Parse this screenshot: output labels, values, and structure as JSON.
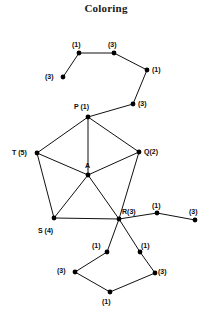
{
  "title": "Coloring",
  "canvas": {
    "width": 212,
    "height": 319,
    "background": "#ffffff"
  },
  "colors": {
    "edge": "#111111",
    "node": "#000000",
    "text": "#0d0d0d"
  },
  "chart_data": {
    "type": "diagram",
    "title": "Coloring",
    "nodes": [
      {
        "id": "n1",
        "label": "(1)",
        "x": 79,
        "y": 53,
        "lx": 72,
        "ly": 41,
        "color": 1
      },
      {
        "id": "n2",
        "label": "(3)",
        "x": 114,
        "y": 53,
        "lx": 108,
        "ly": 41,
        "color": 3
      },
      {
        "id": "n3",
        "label": "(3)",
        "x": 63,
        "y": 77,
        "lx": 45,
        "ly": 73,
        "color": 3
      },
      {
        "id": "n4",
        "label": "(1)",
        "x": 147,
        "y": 70,
        "lx": 152,
        "ly": 66,
        "color": 1
      },
      {
        "id": "n5",
        "label": "(3)",
        "x": 133,
        "y": 104,
        "lx": 138,
        "ly": 100,
        "color": 3
      },
      {
        "id": "P",
        "label": "P (1)",
        "x": 88,
        "y": 117,
        "lx": 74,
        "ly": 103,
        "color": 1
      },
      {
        "id": "T",
        "label": "T (5)",
        "x": 37,
        "y": 153,
        "lx": 12,
        "ly": 149,
        "color": 5
      },
      {
        "id": "Q",
        "label": "Q(2)",
        "x": 139,
        "y": 152,
        "lx": 144,
        "ly": 148,
        "color": 2
      },
      {
        "id": "A",
        "label": "A",
        "x": 88,
        "y": 175,
        "lx": 85,
        "ly": 162,
        "color": null
      },
      {
        "id": "S",
        "label": "S (4)",
        "x": 54,
        "y": 218,
        "lx": 38,
        "ly": 227,
        "color": 4
      },
      {
        "id": "R",
        "label": "R(3)",
        "x": 119,
        "y": 219,
        "lx": 122,
        "ly": 208,
        "color": 3
      },
      {
        "id": "n6",
        "label": "(1)",
        "x": 157,
        "y": 213,
        "lx": 152,
        "ly": 202,
        "color": 1
      },
      {
        "id": "n7",
        "label": "(3)",
        "x": 195,
        "y": 220,
        "lx": 189,
        "ly": 208,
        "color": 3
      },
      {
        "id": "n8",
        "label": "(1)",
        "x": 107,
        "y": 252,
        "lx": 92,
        "ly": 242,
        "color": 1
      },
      {
        "id": "n9",
        "label": "(1)",
        "x": 140,
        "y": 252,
        "lx": 141,
        "ly": 242,
        "color": 1
      },
      {
        "id": "n10",
        "label": "(3)",
        "x": 75,
        "y": 272,
        "lx": 57,
        "ly": 267,
        "color": 3
      },
      {
        "id": "n11",
        "label": "(3)",
        "x": 155,
        "y": 273,
        "lx": 158,
        "ly": 268,
        "color": 3
      },
      {
        "id": "n12",
        "label": "(1)",
        "x": 110,
        "y": 292,
        "lx": 102,
        "ly": 298,
        "color": 1
      }
    ],
    "edges": [
      [
        "n3",
        "n1"
      ],
      [
        "n1",
        "n2"
      ],
      [
        "n2",
        "n4"
      ],
      [
        "n4",
        "n5"
      ],
      [
        "n5",
        "P"
      ],
      [
        "P",
        "T"
      ],
      [
        "P",
        "Q"
      ],
      [
        "P",
        "A"
      ],
      [
        "T",
        "A"
      ],
      [
        "T",
        "S"
      ],
      [
        "Q",
        "A"
      ],
      [
        "Q",
        "R"
      ],
      [
        "A",
        "S"
      ],
      [
        "A",
        "R"
      ],
      [
        "S",
        "R"
      ],
      [
        "R",
        "n6"
      ],
      [
        "n6",
        "n7"
      ],
      [
        "R",
        "n8"
      ],
      [
        "n8",
        "n10"
      ],
      [
        "n10",
        "n12"
      ],
      [
        "n12",
        "n11"
      ],
      [
        "n11",
        "n9"
      ],
      [
        "n9",
        "R"
      ]
    ],
    "legend": [],
    "xlabel": "",
    "ylabel": ""
  }
}
